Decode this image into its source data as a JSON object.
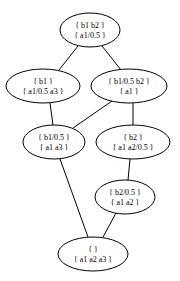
{
  "diagram": {
    "type": "concept-lattice",
    "nodes": [
      {
        "id": "n0",
        "line1": "{ b1 b2 }",
        "line2": "{ a1/0.5 }",
        "cx": 90,
        "cy": 30,
        "rx": 30,
        "ry": 17
      },
      {
        "id": "n1",
        "line1": "{ b1 }",
        "line2": "{ a1/0.5 a3 }",
        "cx": 43,
        "cy": 86,
        "rx": 37,
        "ry": 17
      },
      {
        "id": "n2",
        "line1": "{ b1/0.5 b2 }",
        "line2": "{ a1 }",
        "cx": 129,
        "cy": 86,
        "rx": 38,
        "ry": 17
      },
      {
        "id": "n3",
        "line1": "{ b1/0.5 }",
        "line2": "{ a1 a3 }",
        "cx": 54,
        "cy": 142,
        "rx": 31,
        "ry": 17
      },
      {
        "id": "n4",
        "line1": "{ b2 }",
        "line2": "{ a1 a2/0.5 }",
        "cx": 133,
        "cy": 142,
        "rx": 37,
        "ry": 17
      },
      {
        "id": "n5",
        "line1": "{ b2/0.5 }",
        "line2": "{ a1 a2 }",
        "cx": 125,
        "cy": 197,
        "rx": 30,
        "ry": 17
      },
      {
        "id": "n6",
        "line1": "{ }",
        "line2": "{ a1 a2 a3 }",
        "cx": 93,
        "cy": 254,
        "rx": 35,
        "ry": 17
      }
    ],
    "edges": [
      {
        "from": "n0",
        "to": "n1"
      },
      {
        "from": "n0",
        "to": "n2"
      },
      {
        "from": "n1",
        "to": "n3"
      },
      {
        "from": "n2",
        "to": "n3"
      },
      {
        "from": "n2",
        "to": "n4"
      },
      {
        "from": "n4",
        "to": "n5"
      },
      {
        "from": "n3",
        "to": "n6"
      },
      {
        "from": "n5",
        "to": "n6"
      }
    ]
  }
}
